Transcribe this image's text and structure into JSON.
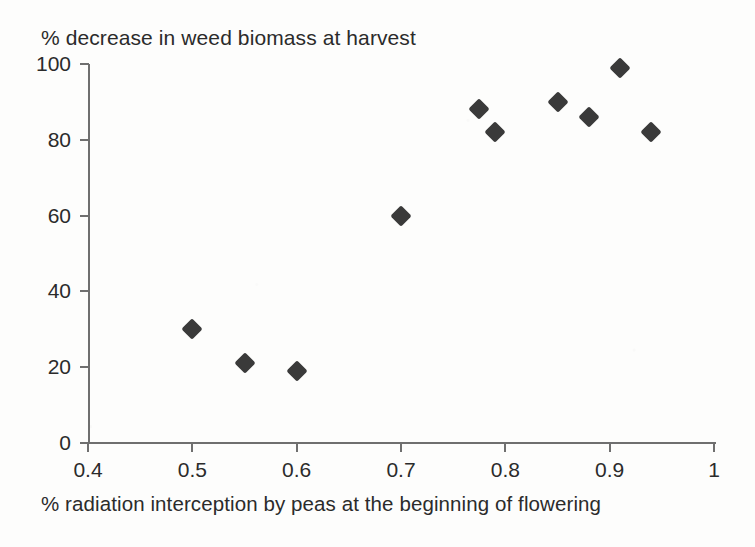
{
  "chart_data": {
    "type": "scatter",
    "title": "% decrease in weed biomass at harvest",
    "xlabel": "% radiation interception by peas at the beginning of flowering",
    "ylabel": "% decrease in weed biomass at harvest",
    "xlim": [
      0.4,
      1.0
    ],
    "ylim": [
      0,
      100
    ],
    "xticks": [
      "0.4",
      "0.5",
      "0.6",
      "0.7",
      "0.8",
      "0.9",
      "1"
    ],
    "xtick_values": [
      0.4,
      0.5,
      0.6,
      0.7,
      0.8,
      0.9,
      1.0
    ],
    "yticks": [
      "0",
      "20",
      "40",
      "60",
      "80",
      "100"
    ],
    "ytick_values": [
      0,
      20,
      40,
      60,
      80,
      100
    ],
    "grid": false,
    "legend": null,
    "marker": "filled-diamond",
    "marker_color": "#3a3a3a",
    "points": [
      {
        "x": 0.5,
        "y": 30
      },
      {
        "x": 0.55,
        "y": 21
      },
      {
        "x": 0.6,
        "y": 19
      },
      {
        "x": 0.7,
        "y": 60
      },
      {
        "x": 0.775,
        "y": 88
      },
      {
        "x": 0.79,
        "y": 82
      },
      {
        "x": 0.85,
        "y": 90
      },
      {
        "x": 0.88,
        "y": 86
      },
      {
        "x": 0.91,
        "y": 99
      },
      {
        "x": 0.94,
        "y": 82
      }
    ]
  },
  "colors": {
    "background": "#fdfdfc",
    "axis": "#6f6f6f",
    "text": "#2b2b2b",
    "marker": "#3a3a3a"
  }
}
